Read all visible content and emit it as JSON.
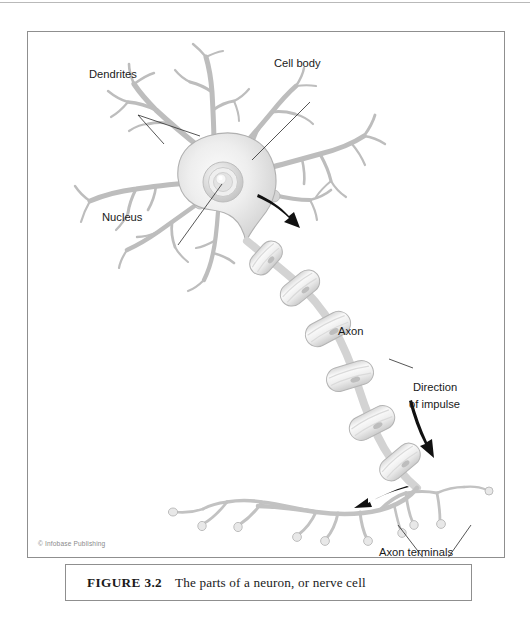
{
  "figure": {
    "caption_label": "FIGURE 3.2",
    "caption_text": "The parts of a neuron, or nerve cell",
    "copyright": "© Infobase Publishing"
  },
  "diagram": {
    "title": "The parts of a neuron, or nerve cell",
    "type": "labeled-biological-diagram",
    "subject": "neuron",
    "labels": [
      {
        "id": "dendrites",
        "text": "Dendrites",
        "x": 88,
        "y": 73
      },
      {
        "id": "cell-body",
        "text": "Cell body",
        "x": 273,
        "y": 62
      },
      {
        "id": "nucleus",
        "text": "Nucleus",
        "x": 101,
        "y": 216
      },
      {
        "id": "axon",
        "text": "Axon",
        "x": 337,
        "y": 330
      },
      {
        "id": "direction-of-impulse-line1",
        "text": "Direction",
        "x": 412,
        "y": 386
      },
      {
        "id": "direction-of-impulse-line2",
        "text": "of impulse",
        "x": 408,
        "y": 403
      },
      {
        "id": "axon-terminals",
        "text": "Axon terminals",
        "x": 378,
        "y": 551
      }
    ],
    "colors": {
      "cell_fill_light": "#f2f2f2",
      "cell_fill_mid": "#d8d8d8",
      "cell_outline": "#a8a8a8",
      "myelin_fill": "#f6f6f6",
      "myelin_outline": "#b5b5b5",
      "leader_line": "#2b2b2b",
      "arrow": "#111111",
      "frame_border": "#8f8f8f",
      "label_text": "#1a1a1a",
      "copyright_text": "#8a8a8a",
      "page_background": "#ffffff"
    },
    "parts": [
      {
        "name": "dendrites",
        "description": "branching tree-like processes radiating from the cell body"
      },
      {
        "name": "cell body",
        "description": "rounded soma containing the nucleus"
      },
      {
        "name": "nucleus",
        "description": "concentric ringed structure at the center of the cell body"
      },
      {
        "name": "axon",
        "description": "long myelinated fiber made of segmented sheath sections"
      },
      {
        "name": "axon terminals",
        "description": "fine branches ending in small knobs"
      }
    ],
    "arrows": [
      {
        "id": "impulse-start-arrow",
        "meaning": "impulse leaving cell body"
      },
      {
        "id": "impulse-mid-arrow",
        "meaning": "direction of impulse along axon"
      },
      {
        "id": "impulse-terminal-arrow",
        "meaning": "impulse reaching axon terminals"
      }
    ]
  }
}
